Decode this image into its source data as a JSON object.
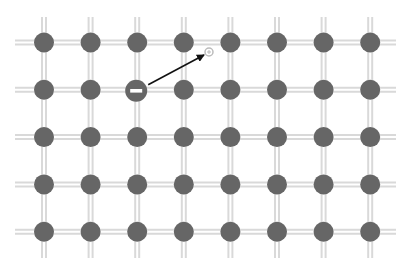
{
  "diagram": {
    "title": "",
    "lattice": {
      "columns": 8,
      "rows": 5,
      "atom_color": "#666666",
      "bond_color": "#d9d9d9"
    },
    "electron": {
      "label": "−",
      "column": 2,
      "row": 2,
      "color": "#666666"
    },
    "hole": {
      "label": "+",
      "color": "#bbbbbb"
    },
    "arrow": {
      "from": "electron",
      "to": "hole",
      "color": "#111111"
    }
  }
}
